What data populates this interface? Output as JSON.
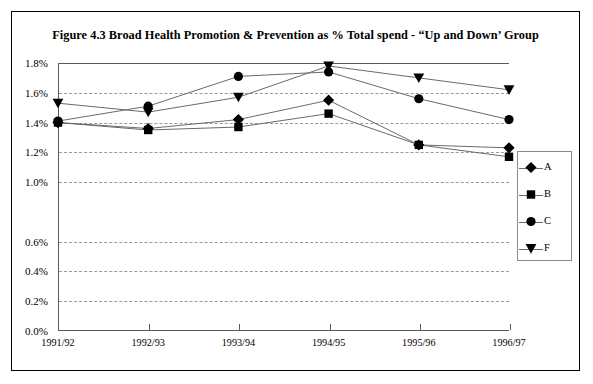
{
  "figure": {
    "title": "Figure 4.3 Broad Health Promotion & Prevention as % Total spend - “Up and Down’ Group"
  },
  "legend": {
    "position": "right",
    "entries": [
      {
        "label": "A",
        "marker": "diamond"
      },
      {
        "label": "B",
        "marker": "square"
      },
      {
        "label": "C",
        "marker": "circle"
      },
      {
        "label": "F",
        "marker": "triangle-down"
      }
    ]
  },
  "chart_data": {
    "type": "line",
    "title": "Figure 4.3 Broad Health Promotion & Prevention as % Total spend - “Up and Down’ Group",
    "xlabel": "",
    "ylabel": "",
    "categories": [
      "1991/92",
      "1992/93",
      "1993/94",
      "1994/95",
      "1995/96",
      "1996/97"
    ],
    "ytick_labels": [
      "0.0%",
      "0.2%",
      "0.4%",
      "0.6%",
      "1.0%",
      "1.2%",
      "1.4%",
      "1.6%",
      "1.8%"
    ],
    "ytick_values": [
      0.0,
      0.2,
      0.4,
      0.6,
      1.0,
      1.2,
      1.4,
      1.6,
      1.8
    ],
    "ylim": [
      0.0,
      1.8
    ],
    "grid": true,
    "legend_position": "right",
    "series": [
      {
        "name": "A",
        "marker": "diamond",
        "values": [
          1.4,
          1.36,
          1.42,
          1.55,
          1.25,
          1.23
        ]
      },
      {
        "name": "B",
        "marker": "square",
        "values": [
          1.4,
          1.35,
          1.37,
          1.46,
          1.25,
          1.17
        ]
      },
      {
        "name": "C",
        "marker": "circle",
        "values": [
          1.41,
          1.51,
          1.71,
          1.74,
          1.56,
          1.42
        ]
      },
      {
        "name": "F",
        "marker": "triangle-down",
        "values": [
          1.53,
          1.47,
          1.57,
          1.78,
          1.7,
          1.62
        ]
      }
    ],
    "colors": {
      "line": "#6a6a6a",
      "marker": "#000000",
      "grid": "#9a9a9a",
      "axis": "#5a5a5a"
    }
  }
}
